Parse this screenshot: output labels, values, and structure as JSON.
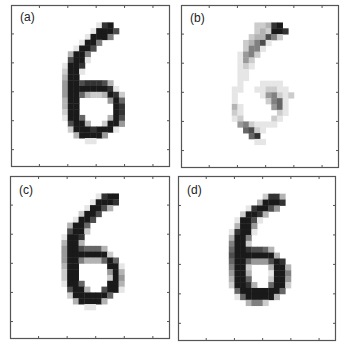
{
  "figure": {
    "panels": [
      {
        "id": "a",
        "label": "(a)",
        "image": [
          "0000000000000000000000000000",
          "0000000000000000000000000000",
          "0000000000000000000000000000",
          "0000000000000001890000000000",
          "0000000000000019997000000000",
          "0000000000000199950000000000",
          "0000000000001995000000000000",
          "0000000000019970000000000000",
          "0000000000399500000000000000",
          "0000000000799100000000000000",
          "0000000001998000000000000000",
          "0000000002991000000000000000",
          "0000000003990000000000000000",
          "0000000004997888730000000000",
          "0000000004999999981000000000",
          "0000000004996322398200000000",
          "0000000003990000049600000000",
          "0000000003990000009800000000",
          "0000000002990000009800000000",
          "0000000001996000039700000000",
          "0000000000799300299400000000",
          "0000000000299989991000000000",
          "0000000000039999400000000000",
          "0000000000000110000000000000",
          "0000000000000000000000000000",
          "0000000000000000000000000000",
          "0000000000000000000000000000",
          "0000000000000000000000000000"
        ]
      },
      {
        "id": "b",
        "label": "(b)",
        "image": [
          "0000000000000000000000000000",
          "0000000000000000000000000000",
          "0000000000000000000000000000",
          "0000000000000223890000000000",
          "0000000000000232998000000000",
          "0000000000002337520000000000",
          "0000000000023571000000000000",
          "0000000000025510000000000000",
          "0000000000145200000000000000",
          "0000000000142000000000000000",
          "0000000000121000000000000000",
          "0000000000110000000000000000",
          "0000000000110000000000000000",
          "0000000000100011110000000000",
          "0000000001100112211000000000",
          "0000000001000014521200000000",
          "0000000001000002561000000000",
          "0000000003100000461000000000",
          "0000000002100000021000000000",
          "0000000001200000210000000000",
          "0000000000452111100000000000",
          "0000000000067210000000000000",
          "0000000000006800000000000000",
          "0000000000000110000000000000",
          "0000000000000000000000000000",
          "0000000000000000000000000000",
          "0000000000000000000000000000",
          "0000000000000000000000000000"
        ]
      },
      {
        "id": "c",
        "label": "(c)",
        "image": [
          "0000000000000000000000000000",
          "0000000000000000000000000000",
          "0000000000000000000000000000",
          "0000000000000001899000000000",
          "0000000000000019998000000000",
          "0000000000000199730000000000",
          "0000000000002997000000000000",
          "0000000000019970000000000000",
          "0000000000399600000000000000",
          "0000000000799200000000000000",
          "0000000001998000000000000000",
          "0000000003993000000000000000",
          "0000000004997666300000000000",
          "0000000004999999920000000000",
          "0000000004995333696000000000",
          "0000000003990000099100000000",
          "0000000002990000049300000000",
          "0000000002990000029400000000",
          "0000000001996000099300000000",
          "0000000000799300799100000000",
          "0000000000299999960000000000",
          "0000000000039999300000000000",
          "0000000000000110000000000000",
          "0000000000000000000000000000",
          "0000000000000000000000000000",
          "0000000000000000000000000000",
          "0000000000000000000000000000",
          "0000000000000000000000000000"
        ]
      },
      {
        "id": "d",
        "label": "(d)",
        "image": [
          "0000000000000000000000000000",
          "0000000000000000000000000000",
          "0000000000000000000000000000",
          "0000000000000002883000000000",
          "0000000000000039998000000000",
          "0000000000001899740000000000",
          "0000000000029983000000000000",
          "0000000000199710000000000000",
          "0000000000399400000000000000",
          "0000000001899100000000000000",
          "0000000003995000000000000000",
          "0000000005992000000000000000",
          "0000000006998776300000000000",
          "0000000007999999930000000000",
          "0000000006996444798000000000",
          "0000000005992000399300000000",
          "0000000004993000199500000000",
          "0000000003996000299400000000",
          "0000000002998300699200000000",
          "0000000000699999996000000000",
          "0000000000169999930000000000",
          "0000000000003552000000000000",
          "0000000000000000000000000000",
          "0000000000000000000000000000",
          "0000000000000000000000000000",
          "0000000000000000000000000000",
          "0000000000000000000000000000",
          "0000000000000000000000000000"
        ]
      }
    ],
    "colors": {
      "ink": "#1a1a1a",
      "frame": "#555555",
      "background": "#ffffff"
    }
  }
}
